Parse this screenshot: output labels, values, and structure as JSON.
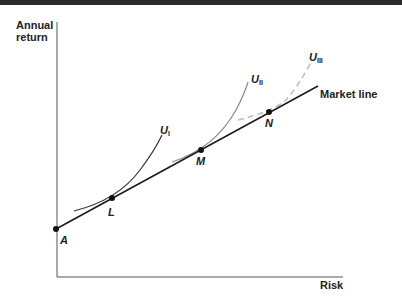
{
  "diagram": {
    "type": "indifference-curves-market-line",
    "axes": {
      "y_label_line1": "Annual",
      "y_label_line2": "return",
      "x_label": "Risk"
    },
    "market_line_label": "Market line",
    "points": [
      {
        "id": "A",
        "label": "A"
      },
      {
        "id": "L",
        "label": "L"
      },
      {
        "id": "M",
        "label": "M"
      },
      {
        "id": "N",
        "label": "N"
      }
    ],
    "curves": [
      {
        "id": "UI",
        "base": "U",
        "sub": "I",
        "style": "solid-dark"
      },
      {
        "id": "UII",
        "base": "U",
        "sub": "II",
        "style": "solid-gray"
      },
      {
        "id": "UIII",
        "base": "U",
        "sub": "III",
        "style": "dashed-lightgray"
      }
    ],
    "colors": {
      "line": "#1a1a1a",
      "curve_ii": "#8a8a8a",
      "curve_iii": "#bdbdbd"
    }
  }
}
